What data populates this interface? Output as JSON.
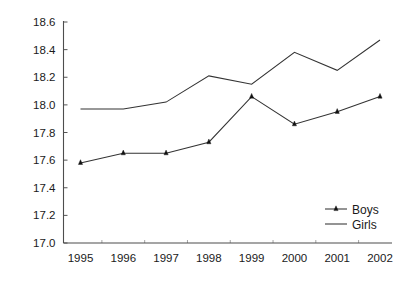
{
  "chart_data": {
    "type": "line",
    "title": "",
    "subtitle": "",
    "xlabel": "",
    "ylabel": "",
    "categories": [
      "1995",
      "1996",
      "1997",
      "1998",
      "1999",
      "2000",
      "2001",
      "2002"
    ],
    "x": [
      1995,
      1996,
      1997,
      1998,
      1999,
      2000,
      2001,
      2002
    ],
    "series": [
      {
        "name": "Boys",
        "marker": "triangle",
        "color": "#222222",
        "values": [
          17.58,
          17.65,
          17.65,
          17.73,
          18.06,
          17.86,
          17.95,
          18.06
        ]
      },
      {
        "name": "Girls",
        "marker": "none",
        "color": "#444444",
        "values": [
          17.97,
          17.97,
          18.02,
          18.21,
          18.15,
          18.38,
          18.25,
          18.47
        ]
      }
    ],
    "ylim": [
      17.0,
      18.6
    ],
    "xlim": [
      1994.6,
      2002.6
    ],
    "ytick_values": [
      17.0,
      17.2,
      17.4,
      17.6,
      17.8,
      18.0,
      18.2,
      18.4,
      18.6
    ],
    "ytick_labels": [
      "17.0",
      "17.2",
      "17.4",
      "17.6",
      "17.8",
      "18.0",
      "18.2",
      "18.4",
      "18.6"
    ],
    "xtick_labels": [
      "1995",
      "1996",
      "1997",
      "1998",
      "1999",
      "2000",
      "2001",
      "2002"
    ],
    "grid": false,
    "legend_position": "bottom-right",
    "legend_entries": [
      {
        "label": "Boys",
        "marker": "triangle"
      },
      {
        "label": "Girls",
        "marker": "none"
      }
    ]
  },
  "axes": {
    "y_axis_name": "y-axis",
    "x_axis_name": "x-axis"
  }
}
